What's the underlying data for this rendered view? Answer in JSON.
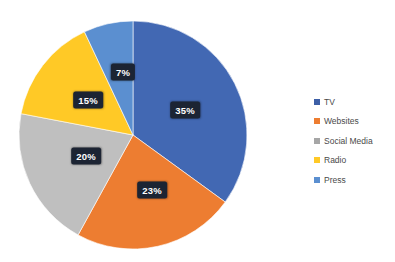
{
  "chart_data": {
    "type": "pie",
    "title": "",
    "categories": [
      "TV",
      "Websites",
      "Social Media",
      "Radio",
      "Press"
    ],
    "values": [
      35,
      23,
      20,
      15,
      7
    ],
    "unit": "%",
    "labels": [
      "35%",
      "23%",
      "20%",
      "15%",
      "7%"
    ],
    "colors": [
      "#4268b3",
      "#ed7d31",
      "#bfbfbf",
      "#ffc926",
      "#5b8fd0"
    ],
    "legend_position": "right",
    "grid": false,
    "start_angle_deg": 0,
    "direction": "clockwise",
    "data_label_background": "#1c2433",
    "data_label_color": "#ffffff",
    "background": "#ffffff"
  },
  "legend": {
    "items": [
      {
        "label": "TV",
        "color": "#3d5fa6"
      },
      {
        "label": "Websites",
        "color": "#ed7d31"
      },
      {
        "label": "Social Media",
        "color": "#a6a6a6"
      },
      {
        "label": "Radio",
        "color": "#ffc926"
      },
      {
        "label": "Press",
        "color": "#5b8fd0"
      }
    ]
  },
  "pie_geometry": {
    "cx": 133,
    "cy": 135,
    "r": 114
  },
  "slice_labels": [
    {
      "text": "35%",
      "x": 185,
      "y": 110
    },
    {
      "text": "23%",
      "x": 152,
      "y": 190
    },
    {
      "text": "20%",
      "x": 86,
      "y": 156
    },
    {
      "text": "15%",
      "x": 88,
      "y": 100
    },
    {
      "text": "7%",
      "x": 123,
      "y": 72
    }
  ]
}
